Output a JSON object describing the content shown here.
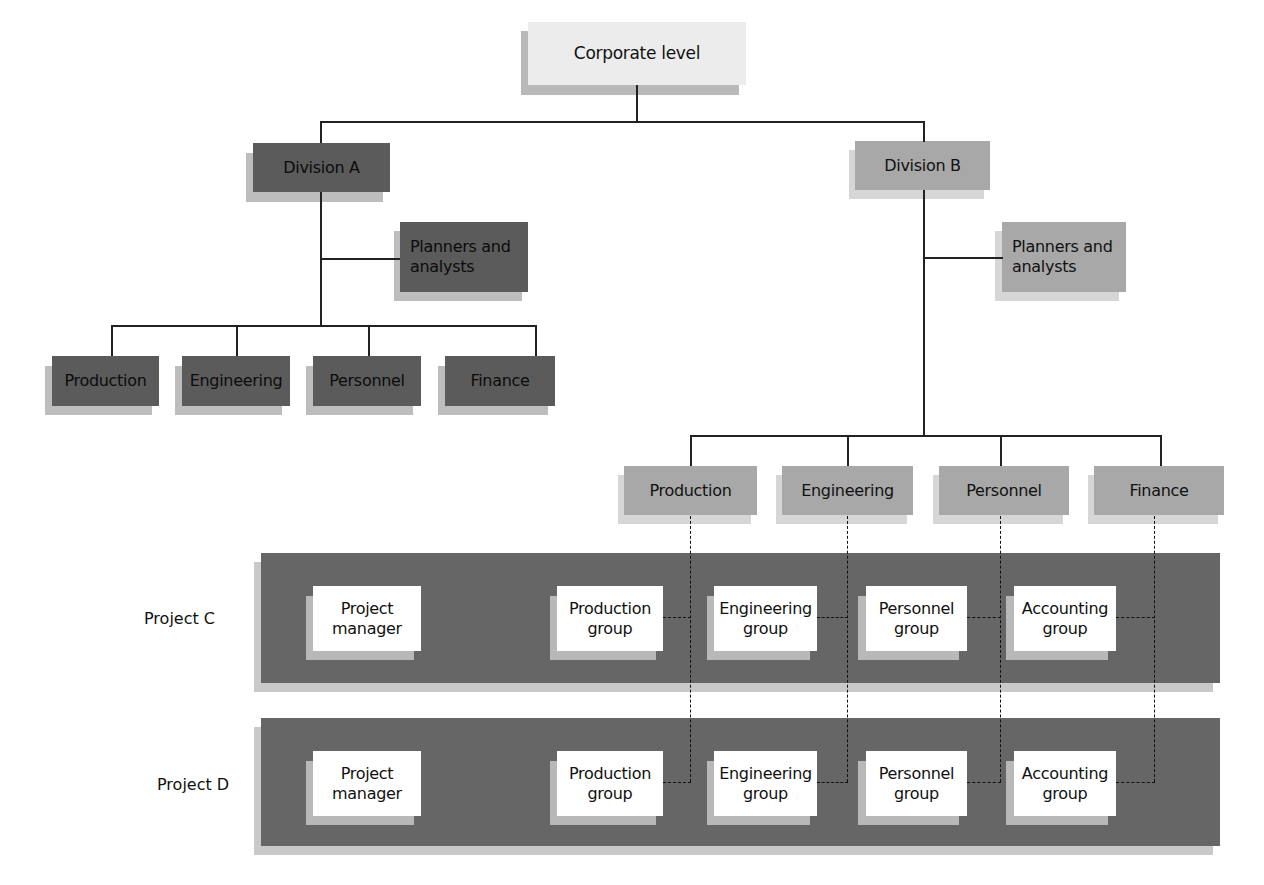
{
  "diagram": {
    "type": "matrix organization chart",
    "colors": {
      "corporate": "#ececec",
      "division_a": "#5b5b5b",
      "division_b": "#a8a8a8",
      "project_band": "#666666",
      "project_box": "#ffffff"
    },
    "corporate": {
      "label": "Corporate level"
    },
    "division_a": {
      "label": "Division A",
      "staff": "Planners and analysts",
      "departments": [
        "Production",
        "Engineering",
        "Personnel",
        "Finance"
      ]
    },
    "division_b": {
      "label": "Division B",
      "staff": "Planners and analysts",
      "departments": [
        "Production",
        "Engineering",
        "Personnel",
        "Finance"
      ]
    },
    "projects": [
      {
        "label": "Project C",
        "manager": [
          "Project",
          "manager"
        ],
        "groups": [
          [
            "Production",
            "group"
          ],
          [
            "Engineering",
            "group"
          ],
          [
            "Personnel",
            "group"
          ],
          [
            "Accounting",
            "group"
          ]
        ]
      },
      {
        "label": "Project D",
        "manager": [
          "Project",
          "manager"
        ],
        "groups": [
          [
            "Production",
            "group"
          ],
          [
            "Engineering",
            "group"
          ],
          [
            "Personnel",
            "group"
          ],
          [
            "Accounting",
            "group"
          ]
        ]
      }
    ]
  }
}
